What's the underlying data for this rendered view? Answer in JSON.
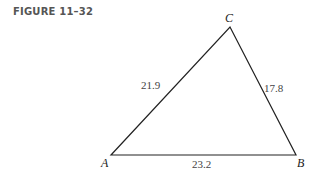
{
  "figure": {
    "caption": "FIGURE 11–32",
    "vertices": [
      {
        "name": "A",
        "x": 111,
        "y": 155,
        "lx": 101,
        "ly": 167
      },
      {
        "name": "B",
        "x": 296,
        "y": 155,
        "lx": 297,
        "ly": 167
      },
      {
        "name": "C",
        "x": 230,
        "y": 27,
        "lx": 225,
        "ly": 22
      }
    ],
    "sides": [
      {
        "between": "AC",
        "label": "21.9",
        "lx": 141,
        "ly": 89
      },
      {
        "between": "CB",
        "label": "17.8",
        "lx": 264,
        "ly": 92
      },
      {
        "between": "AB",
        "label": "23.2",
        "lx": 192,
        "ly": 168
      }
    ],
    "line_color": "#222222"
  }
}
